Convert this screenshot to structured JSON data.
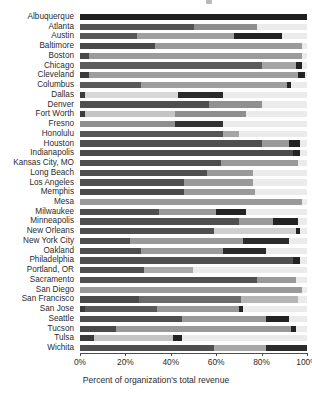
{
  "chart_data": {
    "type": "bar",
    "orientation": "horizontal",
    "stacked": true,
    "normalized_percent": true,
    "title": "",
    "xlabel": "Percent of organization's total revenue",
    "ylabel": "",
    "xlim": [
      0,
      100
    ],
    "xticks": [
      0,
      20,
      40,
      60,
      80,
      100
    ],
    "xtick_labels": [
      "0%",
      "20%",
      "40%",
      "60%",
      "80%",
      "100%"
    ],
    "grid": false,
    "legend": "none",
    "series_colors": [
      "#2b2b2b",
      "#6f6f6f",
      "#9a9a9a",
      "#c9c9c9",
      "#ebebeb"
    ],
    "categories": [
      "Albuquerque",
      "Atlanta",
      "Austin",
      "Baltimore",
      "Boston",
      "Chicago",
      "Cleveland",
      "Columbus",
      "Dallas",
      "Denver",
      "Fort Worth",
      "Fresno",
      "Honolulu",
      "Houston",
      "Indianapolis",
      "Kansas City, MO",
      "Long Beach",
      "Los Angeles",
      "Memphis",
      "Mesa",
      "Milwaukee",
      "Minneapolis",
      "New Orleans",
      "New York City",
      "Oakland",
      "Philadelphia",
      "Portland, OR",
      "Sacramento",
      "San Diego",
      "San Francisco",
      "San Jose",
      "Seattle",
      "Tucson",
      "Tulsa",
      "Wichita"
    ],
    "rows": [
      {
        "city": "Albuquerque",
        "segments": [
          {
            "value": 100.0,
            "color": "#1f1f1f"
          }
        ]
      },
      {
        "city": "Atlanta",
        "segments": [
          {
            "value": 50.0,
            "color": "#545454"
          },
          {
            "value": 28.0,
            "color": "#8e8e8e"
          },
          {
            "value": 22.0,
            "color": "#ebebeb"
          }
        ]
      },
      {
        "city": "Austin",
        "segments": [
          {
            "value": 25.0,
            "color": "#585858"
          },
          {
            "value": 43.0,
            "color": "#a0a0a0"
          },
          {
            "value": 21.0,
            "color": "#232323"
          },
          {
            "value": 11.0,
            "color": "#ebebeb"
          }
        ]
      },
      {
        "city": "Baltimore",
        "segments": [
          {
            "value": 33.0,
            "color": "#4a4a4a"
          },
          {
            "value": 65.0,
            "color": "#9b9b9b"
          },
          {
            "value": 2.0,
            "color": "#ebebeb"
          }
        ]
      },
      {
        "city": "Boston",
        "segments": [
          {
            "value": 4.0,
            "color": "#4a4a4a"
          },
          {
            "value": 94.0,
            "color": "#9b9b9b"
          },
          {
            "value": 2.0,
            "color": "#ebebeb"
          }
        ]
      },
      {
        "city": "Chicago",
        "segments": [
          {
            "value": 80.0,
            "color": "#5c5c5c"
          },
          {
            "value": 15.0,
            "color": "#a5a5a5"
          },
          {
            "value": 3.0,
            "color": "#232323"
          },
          {
            "value": 2.0,
            "color": "#ebebeb"
          }
        ]
      },
      {
        "city": "Cleveland",
        "segments": [
          {
            "value": 4.0,
            "color": "#3c3c3c"
          },
          {
            "value": 92.0,
            "color": "#9e9e9e"
          },
          {
            "value": 3.0,
            "color": "#232323"
          },
          {
            "value": 1.0,
            "color": "#ebebeb"
          }
        ]
      },
      {
        "city": "Columbus",
        "segments": [
          {
            "value": 27.0,
            "color": "#5a5a5a"
          },
          {
            "value": 64.0,
            "color": "#9e9e9e"
          },
          {
            "value": 2.0,
            "color": "#232323"
          },
          {
            "value": 7.0,
            "color": "#ebebeb"
          }
        ]
      },
      {
        "city": "Dallas",
        "segments": [
          {
            "value": 2.0,
            "color": "#3c3c3c"
          },
          {
            "value": 41.0,
            "color": "#d8d8d8"
          },
          {
            "value": 20.0,
            "color": "#2b2b2b"
          },
          {
            "value": 37.0,
            "color": "#ebebeb"
          }
        ]
      },
      {
        "city": "Denver",
        "segments": [
          {
            "value": 57.0,
            "color": "#4f4f4f"
          },
          {
            "value": 23.0,
            "color": "#909090"
          },
          {
            "value": 20.0,
            "color": "#ebebeb"
          }
        ]
      },
      {
        "city": "Fort Worth",
        "segments": [
          {
            "value": 2.0,
            "color": "#3c3c3c"
          },
          {
            "value": 40.0,
            "color": "#c4c4c4"
          },
          {
            "value": 31.0,
            "color": "#8e8e8e"
          },
          {
            "value": 27.0,
            "color": "#ebebeb"
          }
        ]
      },
      {
        "city": "Fresno",
        "segments": [
          {
            "value": 42.0,
            "color": "#8f8f8f"
          },
          {
            "value": 21.0,
            "color": "#333333"
          },
          {
            "value": 37.0,
            "color": "#ebebeb"
          }
        ]
      },
      {
        "city": "Honolulu",
        "segments": [
          {
            "value": 63.0,
            "color": "#555555"
          },
          {
            "value": 7.0,
            "color": "#a5a5a5"
          },
          {
            "value": 30.0,
            "color": "#ebebeb"
          }
        ]
      },
      {
        "city": "Houston",
        "segments": [
          {
            "value": 80.0,
            "color": "#4f4f4f"
          },
          {
            "value": 12.0,
            "color": "#9a9a9a"
          },
          {
            "value": 5.0,
            "color": "#232323"
          },
          {
            "value": 3.0,
            "color": "#ebebeb"
          }
        ]
      },
      {
        "city": "Indianapolis",
        "segments": [
          {
            "value": 94.0,
            "color": "#4a4a4a"
          },
          {
            "value": 3.0,
            "color": "#232323"
          },
          {
            "value": 3.0,
            "color": "#ebebeb"
          }
        ]
      },
      {
        "city": "Kansas City, MO",
        "segments": [
          {
            "value": 62.0,
            "color": "#4f4f4f"
          },
          {
            "value": 34.0,
            "color": "#9a9a9a"
          },
          {
            "value": 4.0,
            "color": "#ebebeb"
          }
        ]
      },
      {
        "city": "Long Beach",
        "segments": [
          {
            "value": 56.0,
            "color": "#4f4f4f"
          },
          {
            "value": 20.0,
            "color": "#9a9a9a"
          },
          {
            "value": 24.0,
            "color": "#ebebeb"
          }
        ]
      },
      {
        "city": "Los Angeles",
        "segments": [
          {
            "value": 46.0,
            "color": "#4f4f4f"
          },
          {
            "value": 30.0,
            "color": "#9a9a9a"
          },
          {
            "value": 24.0,
            "color": "#ebebeb"
          }
        ]
      },
      {
        "city": "Memphis",
        "segments": [
          {
            "value": 46.0,
            "color": "#4a4a4a"
          },
          {
            "value": 31.0,
            "color": "#9a9a9a"
          },
          {
            "value": 23.0,
            "color": "#ebebeb"
          }
        ]
      },
      {
        "city": "Mesa",
        "segments": [
          {
            "value": 98.0,
            "color": "#9a9a9a"
          },
          {
            "value": 2.0,
            "color": "#ebebeb"
          }
        ]
      },
      {
        "city": "Milwaukee",
        "segments": [
          {
            "value": 35.0,
            "color": "#4f4f4f"
          },
          {
            "value": 25.0,
            "color": "#9a9a9a"
          },
          {
            "value": 13.0,
            "color": "#232323"
          },
          {
            "value": 27.0,
            "color": "#ebebeb"
          }
        ]
      },
      {
        "city": "Minneapolis",
        "segments": [
          {
            "value": 70.0,
            "color": "#4f4f4f"
          },
          {
            "value": 15.0,
            "color": "#9a9a9a"
          },
          {
            "value": 11.0,
            "color": "#232323"
          },
          {
            "value": 4.0,
            "color": "#ebebeb"
          }
        ]
      },
      {
        "city": "New Orleans",
        "segments": [
          {
            "value": 59.0,
            "color": "#4f4f4f"
          },
          {
            "value": 36.0,
            "color": "#cfcfcf"
          },
          {
            "value": 2.0,
            "color": "#232323"
          },
          {
            "value": 3.0,
            "color": "#ebebeb"
          }
        ]
      },
      {
        "city": "New York City",
        "segments": [
          {
            "value": 22.0,
            "color": "#4f4f4f"
          },
          {
            "value": 50.0,
            "color": "#9a9a9a"
          },
          {
            "value": 20.0,
            "color": "#2b2b2b"
          },
          {
            "value": 8.0,
            "color": "#ebebeb"
          }
        ]
      },
      {
        "city": "Oakland",
        "segments": [
          {
            "value": 27.0,
            "color": "#4f4f4f"
          },
          {
            "value": 36.0,
            "color": "#9a9a9a"
          },
          {
            "value": 19.0,
            "color": "#2b2b2b"
          },
          {
            "value": 18.0,
            "color": "#ebebeb"
          }
        ]
      },
      {
        "city": "Philadelphia",
        "segments": [
          {
            "value": 94.0,
            "color": "#4f4f4f"
          },
          {
            "value": 3.0,
            "color": "#232323"
          },
          {
            "value": 3.0,
            "color": "#ebebeb"
          }
        ]
      },
      {
        "city": "Portland, OR",
        "segments": [
          {
            "value": 28.0,
            "color": "#4f4f4f"
          },
          {
            "value": 22.0,
            "color": "#a8a8a8"
          },
          {
            "value": 50.0,
            "color": "#ebebeb"
          }
        ]
      },
      {
        "city": "Sacramento",
        "segments": [
          {
            "value": 78.0,
            "color": "#4f4f4f"
          },
          {
            "value": 17.0,
            "color": "#9a9a9a"
          },
          {
            "value": 5.0,
            "color": "#ebebeb"
          }
        ]
      },
      {
        "city": "San Diego",
        "segments": [
          {
            "value": 98.0,
            "color": "#9a9a9a"
          },
          {
            "value": 2.0,
            "color": "#ebebeb"
          }
        ]
      },
      {
        "city": "San Francisco",
        "segments": [
          {
            "value": 26.0,
            "color": "#4a4a4a"
          },
          {
            "value": 45.0,
            "color": "#6b6b6b"
          },
          {
            "value": 25.0,
            "color": "#b5b5b5"
          },
          {
            "value": 4.0,
            "color": "#ebebeb"
          }
        ]
      },
      {
        "city": "San Jose",
        "segments": [
          {
            "value": 2.0,
            "color": "#3c3c3c"
          },
          {
            "value": 32.0,
            "color": "#595959"
          },
          {
            "value": 36.0,
            "color": "#9a9a9a"
          },
          {
            "value": 2.0,
            "color": "#232323"
          },
          {
            "value": 28.0,
            "color": "#ebebeb"
          }
        ]
      },
      {
        "city": "Seattle",
        "segments": [
          {
            "value": 45.0,
            "color": "#4f4f4f"
          },
          {
            "value": 37.0,
            "color": "#9a9a9a"
          },
          {
            "value": 10.0,
            "color": "#232323"
          },
          {
            "value": 8.0,
            "color": "#ebebeb"
          }
        ]
      },
      {
        "city": "Tucson",
        "segments": [
          {
            "value": 16.0,
            "color": "#4a4a4a"
          },
          {
            "value": 77.0,
            "color": "#9a9a9a"
          },
          {
            "value": 2.0,
            "color": "#232323"
          },
          {
            "value": 5.0,
            "color": "#ebebeb"
          }
        ]
      },
      {
        "city": "Tulsa",
        "segments": [
          {
            "value": 6.0,
            "color": "#3c3c3c"
          },
          {
            "value": 35.0,
            "color": "#c4c4c4"
          },
          {
            "value": 4.0,
            "color": "#232323"
          },
          {
            "value": 55.0,
            "color": "#ebebeb"
          }
        ]
      },
      {
        "city": "Wichita",
        "segments": [
          {
            "value": 59.0,
            "color": "#4f4f4f"
          },
          {
            "value": 23.0,
            "color": "#a8a8a8"
          },
          {
            "value": 18.0,
            "color": "#2b2b2b"
          }
        ]
      }
    ]
  }
}
